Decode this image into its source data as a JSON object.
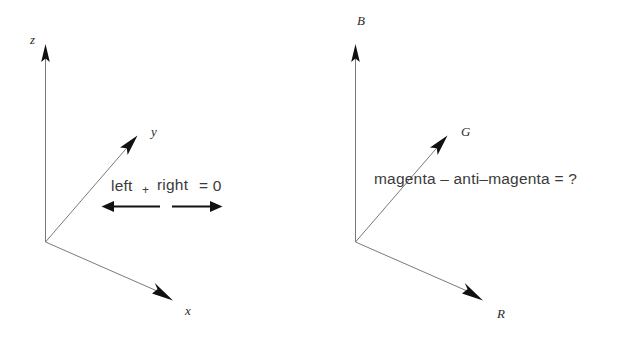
{
  "figure": {
    "background_color": "#ffffff",
    "axis_line_color": "#7a7a7a",
    "arrow_color": "#111111",
    "text_color": "#3a3a3a"
  },
  "panels": [
    {
      "id": "left-panel",
      "name": "xyz-axes-panel",
      "origin": {
        "x": 45,
        "y": 242
      },
      "axes": [
        {
          "name": "z-axis",
          "label": "z",
          "label_x": 30,
          "label_y": 44,
          "tip_x": 46,
          "tip_y": 45
        },
        {
          "name": "y-axis",
          "label": "y",
          "label_x": 151,
          "label_y": 136,
          "tip_x": 137,
          "tip_y": 136
        },
        {
          "name": "x-axis",
          "label": "x",
          "label_x": 185,
          "label_y": 315,
          "tip_x": 172,
          "tip_y": 300
        }
      ],
      "equation": {
        "name": "left-right-equation",
        "term_left": "left",
        "operator": "+",
        "term_right": "right",
        "equals": "= 0",
        "full_text": "left + right = 0",
        "text_x": 112,
        "text_y": 190
      },
      "operation_arrows": [
        {
          "name": "left-pointing-arrow",
          "direction": "left",
          "x_start": 160,
          "x_end": 103,
          "y": 206
        },
        {
          "name": "right-pointing-arrow",
          "direction": "right",
          "x_start": 172,
          "x_end": 222,
          "y": 206
        }
      ]
    },
    {
      "id": "right-panel",
      "name": "rgb-axes-panel",
      "origin": {
        "x": 355,
        "y": 242
      },
      "axes": [
        {
          "name": "b-axis",
          "label": "B",
          "label_x": 358,
          "label_y": 24,
          "tip_x": 356,
          "tip_y": 45
        },
        {
          "name": "g-axis",
          "label": "G",
          "label_x": 461,
          "label_y": 136,
          "tip_x": 447,
          "tip_y": 136
        },
        {
          "name": "r-axis",
          "label": "R",
          "label_x": 497,
          "label_y": 318,
          "tip_x": 482,
          "tip_y": 300
        }
      ],
      "equation": {
        "name": "magenta-equation",
        "full_text": "magenta – anti–magenta = ?",
        "text_x": 375,
        "text_y": 184
      },
      "operation_arrows": []
    }
  ]
}
